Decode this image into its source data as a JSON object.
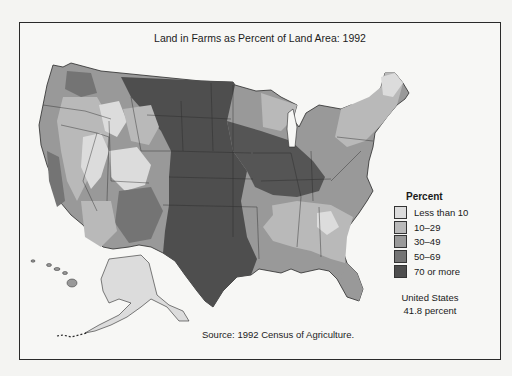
{
  "title": "Land in Farms as Percent of Land Area: 1992",
  "source": "Source: 1992 Census of Agriculture.",
  "legend": {
    "title": "Percent",
    "items": [
      {
        "label": "Less than 10",
        "color": "#dcdcdc"
      },
      {
        "label": "10–29",
        "color": "#b9b9b9"
      },
      {
        "label": "30–49",
        "color": "#999999"
      },
      {
        "label": "50–69",
        "color": "#747474"
      },
      {
        "label": "70 or more",
        "color": "#4e4e4e"
      }
    ]
  },
  "summary": {
    "line1": "United States",
    "line2": "41.8 percent"
  },
  "colors": {
    "lt10": "#dcdcdc",
    "r10_29": "#b9b9b9",
    "r30_49": "#999999",
    "r50_69": "#747474",
    "ge70": "#4e4e4e",
    "border": "#2a2a2a"
  }
}
